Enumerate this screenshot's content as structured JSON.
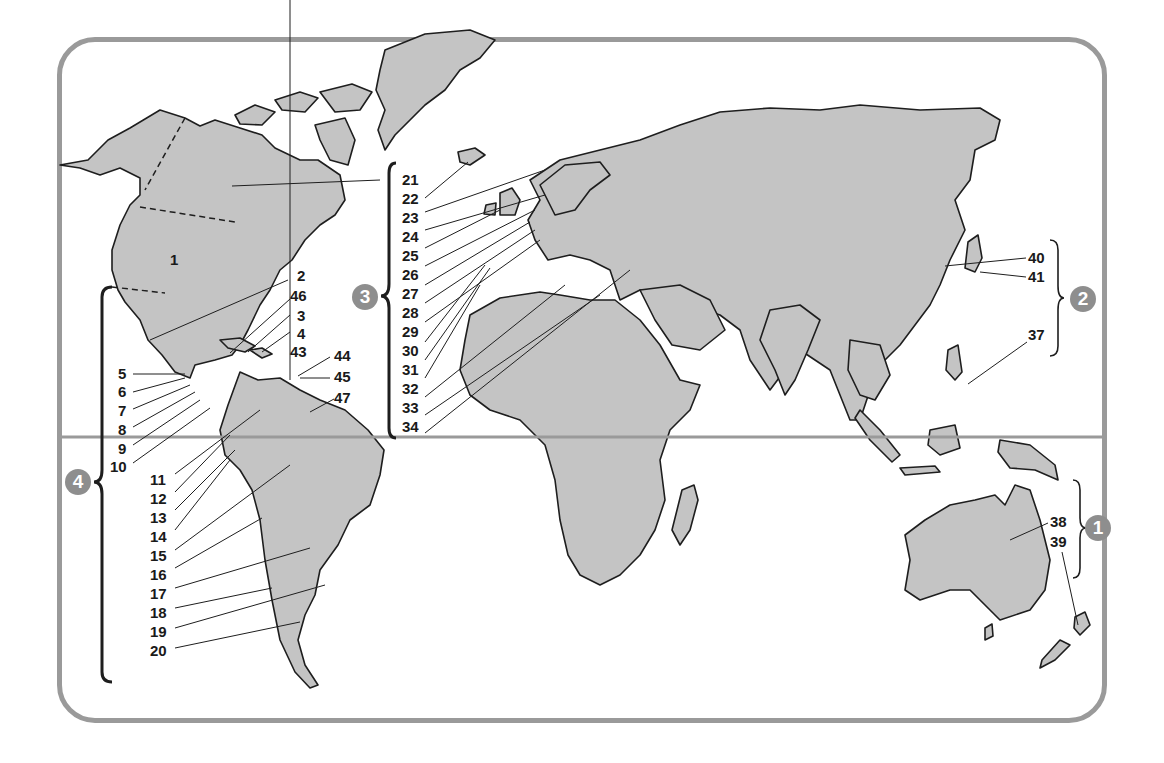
{
  "map": {
    "colors": {
      "land": "#c4c4c4",
      "outline": "#1e1e1e",
      "frame": "#9a9a9a",
      "equator": "#9a9a9a",
      "badge": "#8e8e8e",
      "label": "#1a1a1a"
    },
    "regions": [
      {
        "badge": "1",
        "labels": [
          "38",
          "39"
        ]
      },
      {
        "badge": "2",
        "labels": [
          "40",
          "41",
          "37"
        ]
      },
      {
        "badge": "3",
        "labels": [
          "21",
          "22",
          "23",
          "24",
          "25",
          "26",
          "27",
          "28",
          "29",
          "30",
          "31",
          "32",
          "33",
          "34"
        ]
      },
      {
        "badge": "4",
        "labels": [
          "5",
          "6",
          "7",
          "8",
          "9",
          "10",
          "11",
          "12",
          "13",
          "14",
          "15",
          "16",
          "17",
          "18",
          "19",
          "20"
        ]
      }
    ],
    "labels": {
      "north_america": "1",
      "caribbean": [
        "2",
        "46",
        "3",
        "4",
        "43",
        "44",
        "45",
        "47"
      ],
      "central_america": [
        "5",
        "6",
        "7",
        "8",
        "9",
        "10"
      ],
      "south_america": [
        "11",
        "12",
        "13",
        "14",
        "15",
        "16",
        "17",
        "18",
        "19",
        "20"
      ],
      "europe_africa": [
        "21",
        "22",
        "23",
        "24",
        "25",
        "26",
        "27",
        "28",
        "29",
        "30",
        "31",
        "32",
        "33",
        "34"
      ],
      "east_asia": [
        "40",
        "41",
        "37"
      ],
      "oceania": [
        "38",
        "39"
      ]
    }
  }
}
